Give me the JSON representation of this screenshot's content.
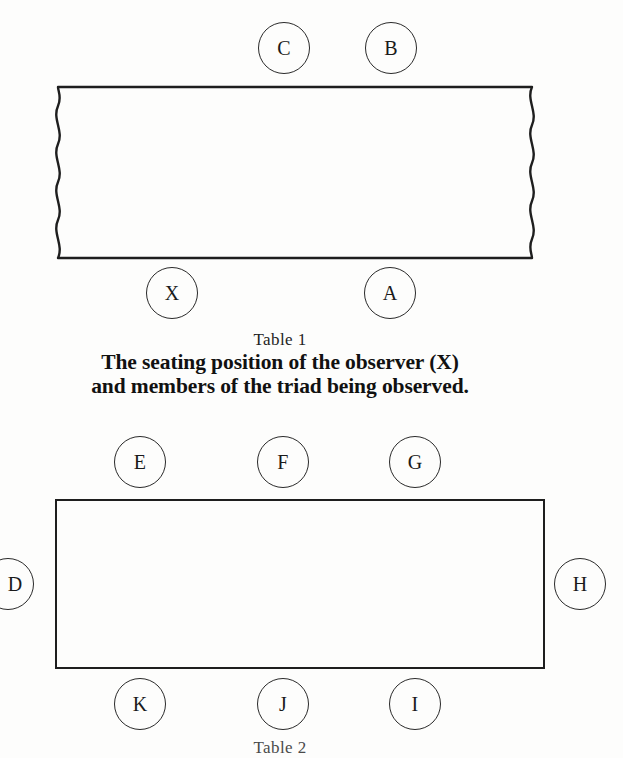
{
  "figure": {
    "background_color": "#fdfdfc",
    "ink_color": "#1a1a1a"
  },
  "diagram_one": {
    "table_name": "table-1-shape",
    "table_style": "torn-edges-rectangle",
    "seats_top": [
      {
        "label": "C"
      },
      {
        "label": "B"
      }
    ],
    "seats_bottom": [
      {
        "label": "X"
      },
      {
        "label": "A"
      }
    ],
    "caption": {
      "number": "Table 1",
      "line_one": "The seating position of the observer (X)",
      "line_two": "and members of the triad being observed.",
      "emphasized": "(X)"
    }
  },
  "diagram_two": {
    "table_name": "table-2-shape",
    "table_style": "plain-rectangle",
    "seats_top": [
      {
        "label": "E"
      },
      {
        "label": "F"
      },
      {
        "label": "G"
      }
    ],
    "seats_left": [
      {
        "label": "D"
      }
    ],
    "seats_right": [
      {
        "label": "H"
      }
    ],
    "seats_bottom": [
      {
        "label": "K"
      },
      {
        "label": "J"
      },
      {
        "label": "I"
      }
    ],
    "caption": {
      "number": "Table 2"
    }
  }
}
